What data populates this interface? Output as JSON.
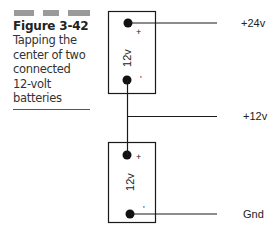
{
  "caption": {
    "figure_number": "Figure 3-42",
    "text_lines": [
      "Tapping the",
      "center of two",
      "connected",
      "12-volt",
      "batteries"
    ]
  },
  "diagram": {
    "batteries": [
      {
        "voltage_label": "12v",
        "positive_symbol": "+",
        "negative_symbol": "-"
      },
      {
        "voltage_label": "12v",
        "positive_symbol": "+",
        "negative_symbol": "-"
      }
    ],
    "outputs": [
      {
        "label": "+24v"
      },
      {
        "label": "+12v"
      },
      {
        "label": "Gnd"
      }
    ]
  },
  "colors": {
    "line": "#1a1a1a",
    "header_bar": "#9a9a9a"
  }
}
